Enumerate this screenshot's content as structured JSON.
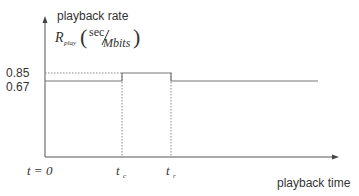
{
  "diagram": {
    "y_axis_label": "playback rate",
    "x_axis_label": "playback time",
    "rate_symbol": "R",
    "rate_subscript": "play",
    "unit_numerator": "sec",
    "unit_denominator": "Mbits",
    "y_ticks": [
      "0.85",
      "0.67"
    ],
    "x_ticks": {
      "origin": "t = 0",
      "tc_base": "t",
      "tc_sub": "c",
      "tr_base": "t",
      "tr_sub": "r"
    },
    "levels": {
      "base_rate": 0.67,
      "peak_rate": 0.85
    },
    "colors": {
      "axis": "#555555",
      "line": "#777777",
      "dotted": "#888888",
      "text": "#333333"
    }
  }
}
